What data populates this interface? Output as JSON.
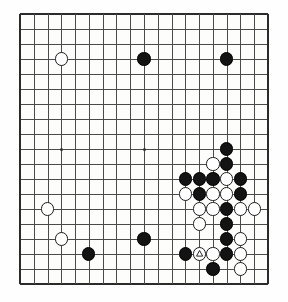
{
  "app": {
    "title": "Go Board Diagram",
    "type": "go-game-diagram"
  },
  "board": {
    "size": 19,
    "visible_columns": 18,
    "visible_rows": 18,
    "origin_x": 20,
    "origin_y": 14,
    "spacing_x": 13.78,
    "spacing_y": 15.0,
    "background_color": "#fdfdfc",
    "line_color": "#4b4b4b",
    "edge_color": "#2b2b2b",
    "black_color": "#131313",
    "white_color": "#ffffff",
    "stone_radius": 6.6,
    "star_points": [
      {
        "col": 3,
        "row": 9
      },
      {
        "col": 9,
        "row": 9
      }
    ]
  },
  "stones": [
    {
      "color": "white",
      "col": 3,
      "row": 3,
      "mark": ""
    },
    {
      "color": "black",
      "col": 9,
      "row": 3,
      "mark": ""
    },
    {
      "color": "black",
      "col": 15,
      "row": 3,
      "mark": ""
    },
    {
      "color": "black",
      "col": 15,
      "row": 9,
      "mark": ""
    },
    {
      "color": "white",
      "col": 14,
      "row": 10,
      "mark": ""
    },
    {
      "color": "black",
      "col": 15,
      "row": 10,
      "mark": ""
    },
    {
      "color": "black",
      "col": 12,
      "row": 11,
      "mark": ""
    },
    {
      "color": "black",
      "col": 13,
      "row": 11,
      "mark": ""
    },
    {
      "color": "black",
      "col": 14,
      "row": 11,
      "mark": ""
    },
    {
      "color": "white",
      "col": 15,
      "row": 11,
      "mark": ""
    },
    {
      "color": "black",
      "col": 16,
      "row": 11,
      "mark": ""
    },
    {
      "color": "white",
      "col": 12,
      "row": 12,
      "mark": ""
    },
    {
      "color": "black",
      "col": 13,
      "row": 12,
      "mark": ""
    },
    {
      "color": "white",
      "col": 14,
      "row": 12,
      "mark": ""
    },
    {
      "color": "white",
      "col": 15,
      "row": 12,
      "mark": ""
    },
    {
      "color": "black",
      "col": 16,
      "row": 12,
      "mark": ""
    },
    {
      "color": "white",
      "col": 13,
      "row": 13,
      "mark": ""
    },
    {
      "color": "white",
      "col": 14,
      "row": 13,
      "mark": ""
    },
    {
      "color": "black",
      "col": 15,
      "row": 13,
      "mark": ""
    },
    {
      "color": "white",
      "col": 16,
      "row": 13,
      "mark": ""
    },
    {
      "color": "white",
      "col": 17,
      "row": 13,
      "mark": ""
    },
    {
      "color": "white",
      "col": 13,
      "row": 14,
      "mark": ""
    },
    {
      "color": "black",
      "col": 15,
      "row": 14,
      "mark": ""
    },
    {
      "color": "black",
      "col": 15,
      "row": 15,
      "mark": ""
    },
    {
      "color": "white",
      "col": 16,
      "row": 15,
      "mark": ""
    },
    {
      "color": "black",
      "col": 12,
      "row": 16,
      "mark": ""
    },
    {
      "color": "white",
      "col": 13,
      "row": 16,
      "mark": "triangle"
    },
    {
      "color": "white",
      "col": 14,
      "row": 16,
      "mark": ""
    },
    {
      "color": "black",
      "col": 15,
      "row": 16,
      "mark": ""
    },
    {
      "color": "white",
      "col": 16,
      "row": 16,
      "mark": ""
    },
    {
      "color": "black",
      "col": 14,
      "row": 17,
      "mark": ""
    },
    {
      "color": "white",
      "col": 16,
      "row": 17,
      "mark": ""
    },
    {
      "color": "white",
      "col": 2,
      "row": 13,
      "mark": ""
    },
    {
      "color": "white",
      "col": 3,
      "row": 15,
      "mark": ""
    },
    {
      "color": "black",
      "col": 5,
      "row": 16,
      "mark": ""
    },
    {
      "color": "black",
      "col": 9,
      "row": 15,
      "mark": ""
    }
  ],
  "marks": {
    "triangle_label": "triangle-mark",
    "triangle_stroke": "#111111"
  }
}
